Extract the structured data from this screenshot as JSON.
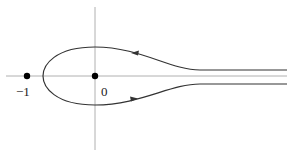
{
  "diagram": {
    "type": "contour-plot",
    "labels": {
      "minus_one": "−1",
      "zero": "0"
    },
    "points": [
      {
        "name": "-1",
        "x": -1
      },
      {
        "name": "0",
        "x": 0
      }
    ],
    "contour": {
      "description": "keyhole contour around 0 extending to +infinity along the real axis",
      "orientation_top": "leftward",
      "orientation_bottom": "rightward"
    },
    "colors": {
      "axis": "#aaaaaa",
      "curve": "#333333",
      "point": "#000000"
    }
  }
}
